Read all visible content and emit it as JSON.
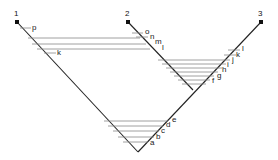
{
  "diagram": {
    "nodes": [
      {
        "id": "1",
        "label": "1"
      },
      {
        "id": "2",
        "label": "2"
      },
      {
        "id": "3",
        "label": "3"
      }
    ],
    "tick_labels": {
      "a": "a",
      "b": "b",
      "c": "c",
      "d": "d",
      "e": "e",
      "f": "f",
      "g": "g",
      "h": "h",
      "i": "i",
      "j": "j",
      "k_right": "k",
      "l_right": "l",
      "l_mid": "l",
      "m": "m",
      "n": "n",
      "o": "o",
      "k_left": "k",
      "p": "p"
    },
    "colors": {
      "line": "#222222",
      "hatch": "#888888",
      "node": "#111111"
    }
  }
}
